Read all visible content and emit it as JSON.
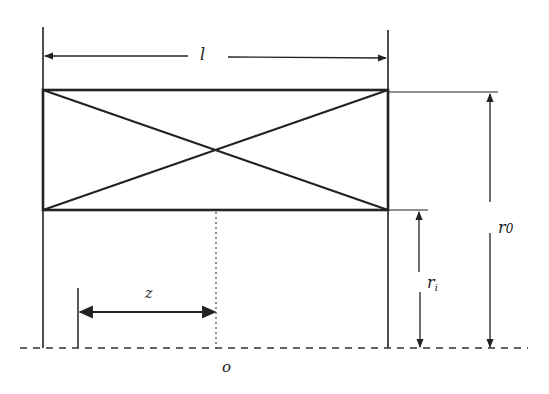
{
  "diagram": {
    "type": "cross-section schematic",
    "colors": {
      "stroke": "#222222",
      "background": "#ffffff"
    },
    "labels": {
      "length": "l",
      "outer_radius": "r",
      "outer_radius_sub": "0",
      "inner_radius": "r",
      "inner_radius_sub": "i",
      "axial_offset": "z",
      "origin": "o"
    },
    "elements": [
      "rectangle-with-diagonals",
      "length-dimension-l",
      "outer-radius-dimension-r0",
      "inner-radius-dimension-ri",
      "axial-offset-dimension-z",
      "center-dotted-line",
      "axis-dashed-baseline",
      "origin-label-o"
    ]
  }
}
